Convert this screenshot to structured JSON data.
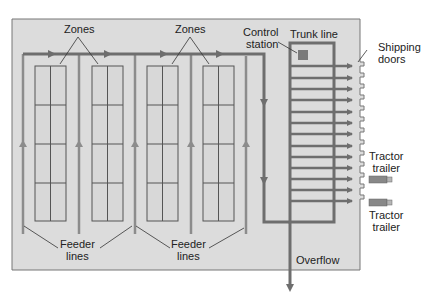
{
  "diagram": {
    "type": "warehouse-conveyor-layout",
    "labels": {
      "zones_left": "Zones",
      "zones_right": "Zones",
      "control_station_line1": "Control",
      "control_station_line2": "station",
      "trunk_line": "Trunk line",
      "shipping_doors_line1": "Shipping",
      "shipping_doors_line2": "doors",
      "tractor_trailer_1_line1": "Tractor",
      "tractor_trailer_1_line2": "trailer",
      "tractor_trailer_2_line1": "Tractor",
      "tractor_trailer_2_line2": "trailer",
      "feeder_left_line1": "Feeder",
      "feeder_left_line2": "lines",
      "feeder_right_line1": "Feeder",
      "feeder_right_line2": "lines",
      "overflow": "Overflow"
    },
    "counts": {
      "zone_racks": 4,
      "feeder_lines": 5,
      "trunk_branches": 13,
      "shipping_doors": 13,
      "tractor_trailers": 2
    },
    "colors": {
      "floor": "#dcdcdc",
      "conveyor": "#6e6e6e",
      "feeder": "#8c8c8c",
      "rack_line": "#555555",
      "control_station": "#7a7a7a",
      "trailer_body": "#888888",
      "trailer_cab": "#b5b5b5"
    }
  }
}
